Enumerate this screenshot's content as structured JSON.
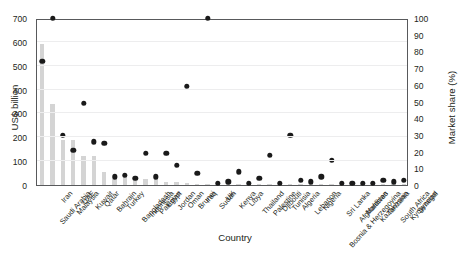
{
  "chart_data": {
    "type": "bar",
    "title": "",
    "xlabel": "Country",
    "ylabel": "US$ billion",
    "ylabel_secondary": "Market share (%)",
    "ylim": [
      0,
      700
    ],
    "ylim_secondary": [
      0,
      100
    ],
    "yticks": [
      0,
      100,
      200,
      300,
      400,
      500,
      600,
      700
    ],
    "yticks_secondary": [
      0,
      10,
      20,
      30,
      40,
      50,
      60,
      70,
      80,
      90,
      100
    ],
    "grid": true,
    "legend_position": "none",
    "bar_color": "#d4d4d4",
    "dot_color": "#1a1a1a",
    "categories": [
      "Saudi Arabia",
      "Iran",
      "Malaysia",
      "UAE",
      "Kuwait",
      "Qatar",
      "Bahrain",
      "Turkey",
      "Bangladesh",
      "Indonesia",
      "Pakistan",
      "Egypt",
      "Jordan",
      "Oman",
      "Brunei",
      "Iraq",
      "Sudan",
      "UK",
      "Kenya",
      "Libya",
      "Thailand",
      "Palestine",
      "Djibouti",
      "Tunisia",
      "Algeria",
      "Lebanon",
      "Nigeria",
      "Bosnia & Herzegovina",
      "Sri Lanka",
      "Afghanistan",
      "Maldives",
      "Kazakhstan",
      "Tanzania",
      "South Africa",
      "Kyrgyzstan",
      "Senegal"
    ],
    "series": [
      {
        "name": "US$ billion",
        "axis": "left",
        "render": "bar",
        "values": [
          590,
          340,
          190,
          190,
          122,
          120,
          56,
          26,
          38,
          34,
          27,
          25,
          12,
          11,
          9,
          4,
          3,
          2,
          2,
          2,
          2,
          1.5,
          1.5,
          1.5,
          1.5,
          1.5,
          1.5,
          1,
          1,
          1,
          1,
          1,
          1,
          1,
          1,
          1
        ]
      },
      {
        "name": "Market share (%)",
        "axis": "right",
        "render": "scatter",
        "values": [
          74,
          100,
          30,
          21,
          49,
          26,
          25,
          5,
          6,
          4,
          19,
          5,
          19,
          12,
          59,
          7,
          100,
          1,
          2,
          8,
          1,
          4,
          18,
          1,
          30,
          3,
          2,
          5,
          15,
          1,
          1,
          1,
          1,
          3,
          2,
          3
        ]
      }
    ]
  }
}
